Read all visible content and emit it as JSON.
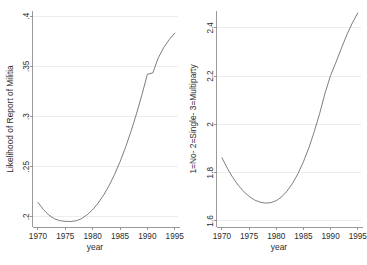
{
  "figure": {
    "background_color": "#ffffff",
    "curve_color": "#6e6e6e",
    "axis_color": "#8e8e8e",
    "grid_color": "#e9e9e9"
  },
  "chart_data": [
    {
      "type": "line",
      "panel": "left",
      "title": "",
      "xlabel": "year",
      "ylabel": "Likelihood of Report of Militia",
      "xlim": [
        1969.0,
        1995.6
      ],
      "ylim": [
        0.19,
        0.405
      ],
      "xticks": [
        1970,
        1975,
        1980,
        1985,
        1990,
        1995
      ],
      "xticklabels": [
        "1970",
        "1975",
        "1980",
        "1985",
        "1990",
        "1995"
      ],
      "yticks": [
        0.2,
        0.25,
        0.3,
        0.35,
        0.4
      ],
      "yticklabels": [
        ".2",
        ".25",
        ".3",
        ".35",
        ".4"
      ],
      "grid": "horizontal",
      "legend": "none",
      "x": [
        1970,
        1971,
        1972,
        1973,
        1974,
        1975,
        1976,
        1977,
        1978,
        1979,
        1980,
        1981,
        1982,
        1983,
        1984,
        1985,
        1986,
        1987,
        1988,
        1989,
        1990,
        1991,
        1992,
        1993,
        1994,
        1995
      ],
      "y": [
        0.2145,
        0.2073,
        0.2018,
        0.1982,
        0.1963,
        0.1956,
        0.1955,
        0.1962,
        0.1984,
        0.2022,
        0.2072,
        0.2138,
        0.2218,
        0.2312,
        0.2423,
        0.2549,
        0.2692,
        0.2851,
        0.3025,
        0.3215,
        0.342,
        0.3434,
        0.3585,
        0.3687,
        0.3766,
        0.383
      ]
    },
    {
      "type": "line",
      "panel": "right",
      "title": "",
      "xlabel": "year",
      "ylabel": "1=No- 2=Single- 3=Multiparty",
      "xlim": [
        1969.0,
        1995.6
      ],
      "ylim": [
        1.575,
        2.47
      ],
      "xticks": [
        1970,
        1975,
        1980,
        1985,
        1990,
        1995
      ],
      "xticklabels": [
        "1970",
        "1975",
        "1980",
        "1985",
        "1990",
        "1995"
      ],
      "yticks": [
        1.6,
        1.8,
        2.0,
        2.2,
        2.4
      ],
      "yticklabels": [
        "1.6",
        "1.8",
        "2",
        "2.2",
        "2.4"
      ],
      "grid": "horizontal",
      "legend": "none",
      "x": [
        1970,
        1971,
        1972,
        1973,
        1974,
        1975,
        1976,
        1977,
        1978,
        1979,
        1980,
        1981,
        1982,
        1983,
        1984,
        1985,
        1986,
        1987,
        1988,
        1989,
        1990,
        1991,
        1992,
        1993,
        1994,
        1995
      ],
      "y": [
        1.862,
        1.818,
        1.78,
        1.748,
        1.722,
        1.702,
        1.687,
        1.678,
        1.674,
        1.676,
        1.684,
        1.7,
        1.724,
        1.756,
        1.796,
        1.845,
        1.903,
        1.97,
        2.046,
        2.131,
        2.203,
        2.258,
        2.316,
        2.372,
        2.42,
        2.462
      ]
    }
  ]
}
